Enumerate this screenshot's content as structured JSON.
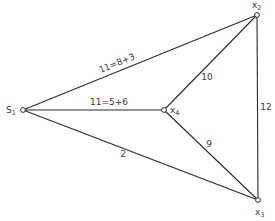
{
  "diagram": {
    "type": "network-graph",
    "nodes": [
      {
        "id": "S1",
        "label": "S",
        "subscript": "1",
        "x": 23,
        "y": 110
      },
      {
        "id": "X2",
        "label": "x",
        "subscript": "2",
        "x": 257,
        "y": 15
      },
      {
        "id": "X3",
        "label": "x",
        "subscript": "3",
        "x": 258,
        "y": 200
      },
      {
        "id": "X4",
        "label": "x",
        "subscript": "4",
        "x": 164,
        "y": 110
      }
    ],
    "edges": [
      {
        "from": "S1",
        "to": "X2",
        "label": "11=8+3"
      },
      {
        "from": "S1",
        "to": "X4",
        "label": "11=5+6"
      },
      {
        "from": "S1",
        "to": "X3",
        "label": "2"
      },
      {
        "from": "X4",
        "to": "X2",
        "label": "10"
      },
      {
        "from": "X4",
        "to": "X3",
        "label": "9"
      },
      {
        "from": "X2",
        "to": "X3",
        "label": "12"
      }
    ]
  }
}
